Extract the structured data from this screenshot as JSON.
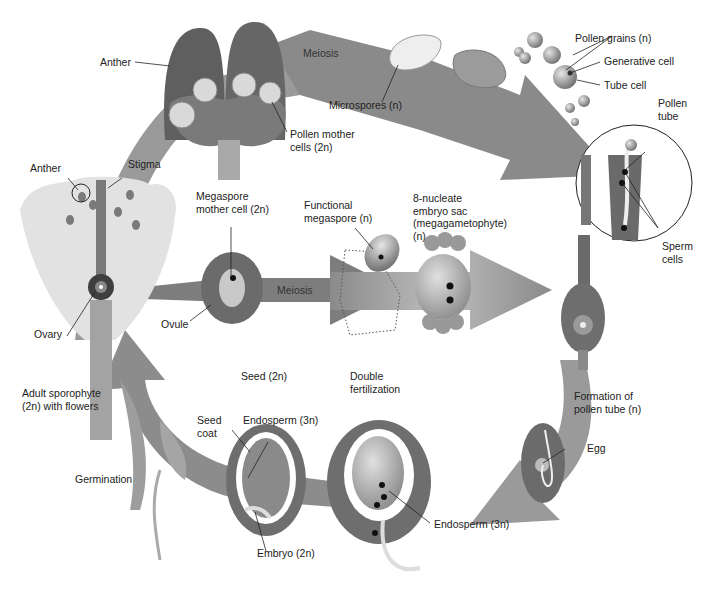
{
  "diagram": {
    "arrow_labels": {
      "top_meiosis": "Meiosis",
      "middle_meiosis": "Meiosis"
    },
    "labels": {
      "anther_top": "Anther",
      "pollen_mother_cells": "Pollen mother\ncells (2n)",
      "microspores": "Microspores (n)",
      "pollen_grains": "Pollen grains (n)",
      "generative_cell": "Generative cell",
      "tube_cell": "Tube cell",
      "pollen_tube": "Pollen\ntube",
      "sperm_cells": "Sperm\ncells",
      "anther_flower": "Anther",
      "stigma": "Stigma",
      "megaspore_mother_cell": "Megaspore\nmother cell (2n)",
      "functional_megaspore": "Functional\nmegaspore (n)",
      "embryo_sac": "8-nucleate\nembryo sac\n(megagametophyte)\n(n)",
      "ovule": "Ovule",
      "ovary": "Ovary",
      "adult_sporophyte": "Adult sporophyte\n(2n) with flowers",
      "seed": "Seed (2n)",
      "double_fertilization": "Double\nfertilization",
      "formation_pollen_tube": "Formation of\npollen tube (n)",
      "seed_coat": "Seed\ncoat",
      "endosperm_seed": "Endosperm (3n)",
      "egg": "Egg",
      "germination": "Germination",
      "endosperm_fert": "Endosperm (3n)",
      "embryo": "Embryo (2n)"
    },
    "colors": {
      "tissue": "#6e6e6e",
      "tissue_light": "#a8a8a8",
      "arrow": "#8c8c8c",
      "flower": "#dcdcdc"
    }
  }
}
